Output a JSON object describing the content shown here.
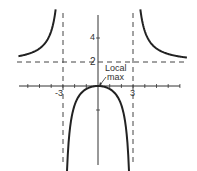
{
  "chart_data": {
    "type": "line",
    "title": "",
    "xlabel": "",
    "ylabel": "",
    "function_hint": "rational function with vertical asymptotes x=-3, x=3 and horizontal asymptote y=2",
    "xlim": [
      -7,
      7.5
    ],
    "ylim": [
      -7,
      6
    ],
    "x_tick_labels": [
      "-3",
      "3"
    ],
    "y_tick_labels": [
      "2",
      "4"
    ],
    "asymptotes": {
      "vertical": [
        -3,
        3
      ],
      "horizontal": [
        2
      ]
    },
    "annotations": [
      {
        "text": "Local max",
        "x": 0,
        "y": 0
      }
    ],
    "series": [
      {
        "name": "left branch",
        "points": [
          [
            -6.5,
            2.6
          ],
          [
            -6,
            2.67
          ],
          [
            -5,
            3.13
          ],
          [
            -4.5,
            3.6
          ],
          [
            -4,
            4.57
          ],
          [
            -3.7,
            5.9
          ]
        ]
      },
      {
        "name": "middle branch",
        "points": [
          [
            -2.7,
            -7.6
          ],
          [
            -2.5,
            -5.45
          ],
          [
            -2,
            -3.2
          ],
          [
            -1.5,
            -1.33
          ],
          [
            -1,
            -0.5
          ],
          [
            0,
            0
          ],
          [
            1,
            -0.5
          ],
          [
            1.5,
            -1.33
          ],
          [
            2,
            -3.2
          ],
          [
            2.5,
            -5.45
          ],
          [
            2.7,
            -7.6
          ]
        ]
      },
      {
        "name": "right branch",
        "points": [
          [
            3.7,
            5.9
          ],
          [
            4,
            4.57
          ],
          [
            4.5,
            3.6
          ],
          [
            5,
            3.13
          ],
          [
            6,
            2.67
          ],
          [
            7,
            2.45
          ]
        ]
      }
    ],
    "grid": false
  },
  "labels": {
    "x_neg3": "-3",
    "x_pos3": "3",
    "y_2": "2",
    "y_4": "4",
    "local_max_line1": "Local",
    "local_max_line2": "max"
  }
}
